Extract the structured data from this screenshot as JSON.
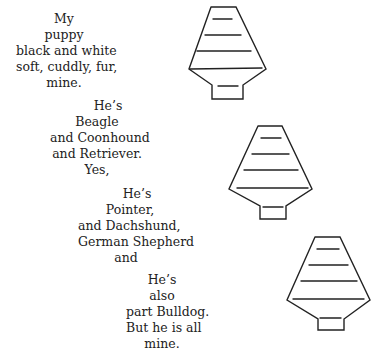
{
  "poem": {
    "stanzas": [
      {
        "lines": [
          "My",
          "puppy",
          "black and white",
          "soft,  cuddly,  fur,",
          "mine."
        ]
      },
      {
        "lines": [
          "He’s",
          "Beagle",
          "and Coonhound",
          "and Retriever.",
          "Yes,"
        ]
      },
      {
        "lines": [
          "He’s",
          "Pointer,",
          "and Dachshund,",
          "German Shepherd",
          "and"
        ]
      },
      {
        "lines": [
          "He’s",
          "also",
          "part Bulldog.",
          "But he is all",
          "mine."
        ]
      }
    ]
  },
  "illustrations": [
    {
      "name": "lantern-drawing-1"
    },
    {
      "name": "lantern-drawing-2"
    },
    {
      "name": "lantern-drawing-3"
    }
  ]
}
